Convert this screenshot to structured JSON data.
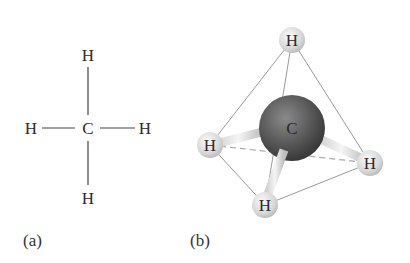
{
  "panel_a": {
    "caption": "(a)",
    "center_atom": "C",
    "atoms": {
      "top": "H",
      "left": "H",
      "right": "H",
      "bottom": "H"
    }
  },
  "panel_b": {
    "caption": "(b)",
    "center_atom": "C",
    "atoms": {
      "top": "H",
      "left": "H",
      "right": "H",
      "bottom": "H"
    }
  },
  "colors": {
    "carbon": "#5a5a5a",
    "hydrogen": "#d8d8d8",
    "edges": "#9a9a9a"
  }
}
